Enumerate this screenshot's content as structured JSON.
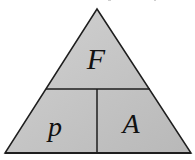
{
  "diagram": {
    "type": "formula-triangle",
    "top": {
      "label": "F"
    },
    "bottom_left": {
      "label": "p"
    },
    "bottom_right": {
      "label": "A"
    },
    "colors": {
      "fill_light": "#d0d0d0",
      "fill_dark": "#b9b9b9",
      "stroke": "#1e1e1e",
      "text": "#111111",
      "background": "#ffffff"
    },
    "geometry": {
      "apex": [
        97,
        9
      ],
      "bottom_left": [
        5,
        153
      ],
      "bottom_right": [
        191,
        153
      ],
      "divider_y": 89,
      "divider_left_x": 46,
      "divider_right_x": 150,
      "vertical_divider_x": 97
    }
  }
}
